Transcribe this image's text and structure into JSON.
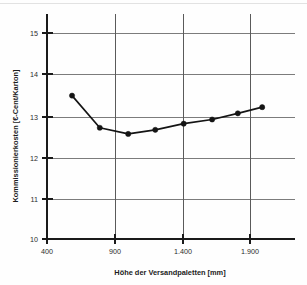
{
  "chart_data": {
    "type": "line",
    "title": "",
    "xlabel": "Höhe der Versandpaletten [mm]",
    "ylabel": "Kommissionierkosten [€-Cent/Karton]",
    "xlim": [
      400,
      2150
    ],
    "ylim": [
      10,
      15
    ],
    "xticks": [
      400,
      900,
      1400,
      1900
    ],
    "xticklabels": [
      "400",
      "900",
      "1.400",
      "1.900"
    ],
    "yticks": [
      10,
      11,
      12,
      13,
      14,
      15
    ],
    "yticklabels": [
      "10",
      "11",
      "12",
      "13",
      "14",
      "15"
    ],
    "grid": "horizontal-and-vertical",
    "legend": "none",
    "series": [
      {
        "name": "Kommissionierkosten",
        "marker": "filled-circle",
        "x": [
          585,
          790,
          1000,
          1200,
          1410,
          1620,
          1810,
          1990
        ],
        "values": [
          13.48,
          12.7,
          12.55,
          12.65,
          12.8,
          12.9,
          13.05,
          13.2
        ]
      }
    ]
  },
  "axes": {
    "x_title": "Höhe der Versandpaletten [mm]",
    "y_title": "Kommissionierkosten [€-Cent/Karton]"
  },
  "ticks": {
    "x": [
      "400",
      "900",
      "1.400",
      "1.900"
    ],
    "y": [
      "10",
      "11",
      "12",
      "13",
      "14",
      "15"
    ]
  },
  "colors": {
    "series": "#141414",
    "gridline": "#6e6e6e",
    "axis": "#1a1a1a",
    "background": "#fefefe"
  }
}
